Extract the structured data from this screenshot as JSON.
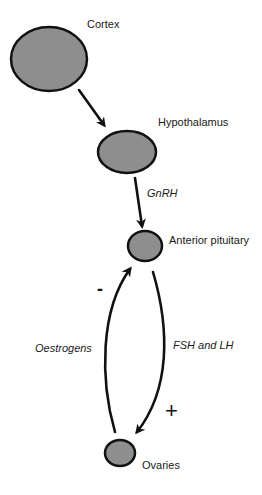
{
  "diagram": {
    "type": "hormonal feedback flow diagram",
    "colors": {
      "node_fill": "#8e8e8e",
      "stroke": "#111111",
      "background": "#ffffff"
    },
    "nodes": [
      {
        "id": "cortex",
        "label": "Cortex"
      },
      {
        "id": "hypothalamus",
        "label": "Hypothalamus"
      },
      {
        "id": "anterior_pituitary",
        "label": "Anterior pituitary"
      },
      {
        "id": "ovaries",
        "label": "Ovaries"
      }
    ],
    "edges": [
      {
        "from": "cortex",
        "to": "hypothalamus",
        "label": ""
      },
      {
        "from": "hypothalamus",
        "to": "anterior_pituitary",
        "label": "GnRH"
      },
      {
        "from": "anterior_pituitary",
        "to": "ovaries",
        "label": "FSH and LH",
        "sign": "+"
      },
      {
        "from": "ovaries",
        "to": "anterior_pituitary",
        "label": "Oestrogens",
        "sign": "-"
      }
    ]
  }
}
